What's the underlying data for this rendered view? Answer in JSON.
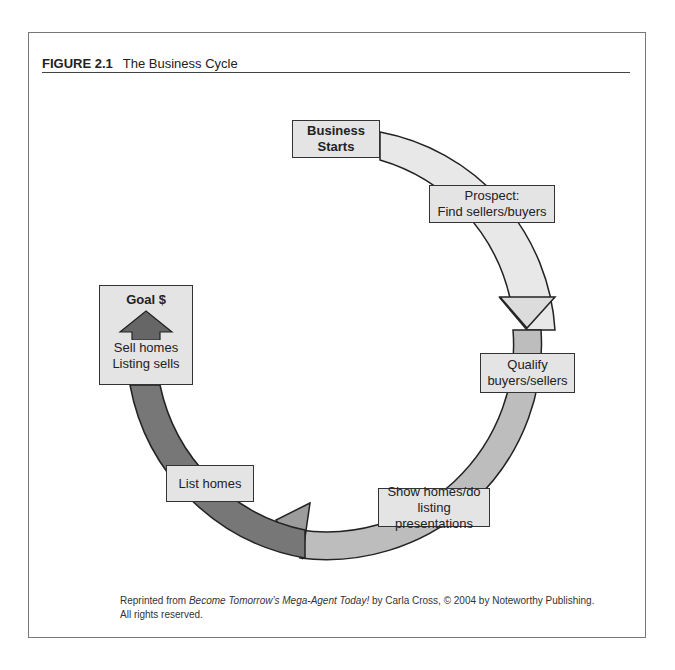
{
  "figure": {
    "number": "FIGURE 2.1",
    "title": "The Business Cycle"
  },
  "nodes": {
    "start": {
      "line1": "Business",
      "line2": "Starts"
    },
    "prospect": {
      "line1": "Prospect:",
      "line2": "Find sellers/buyers"
    },
    "qualify": {
      "line1": "Qualify",
      "line2": "buyers/sellers"
    },
    "show": {
      "line1": "Show homes/do",
      "line2": "listing presentations"
    },
    "list": {
      "line1": "List homes"
    },
    "goal": {
      "title": "Goal $",
      "line1": "Sell homes",
      "line2": "Listing sells"
    }
  },
  "caption": {
    "prefix": "Reprinted from ",
    "book": "Become Tomorrow’s Mega-Agent Today!",
    "suffix": " by Carla Cross, © 2004 by Noteworthy Publishing.",
    "line2": "All rights reserved."
  }
}
